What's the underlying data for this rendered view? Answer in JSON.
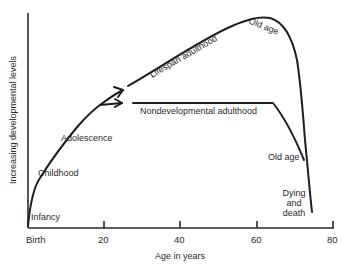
{
  "diagram": {
    "y_axis_label": "Increasing developmental levels",
    "x_axis_label": "Age in years",
    "x_ticks": [
      "Birth",
      "20",
      "40",
      "60",
      "80"
    ],
    "stages": {
      "infancy": "Infancy",
      "childhood": "Childhood",
      "adolescence": "Adolescence",
      "lifespan_adulthood": "Lifespan adulthood",
      "nondevelopmental_adulthood": "Nondevelopmental adulthood",
      "old_age_top": "Old age",
      "old_age_lower": "Old age",
      "dying_line1": "Dying",
      "dying_line2": "and",
      "dying_line3": "death"
    },
    "colors": {
      "line": "#1e1e1e",
      "text": "#2a2a2a",
      "background": "#ffffff"
    }
  }
}
